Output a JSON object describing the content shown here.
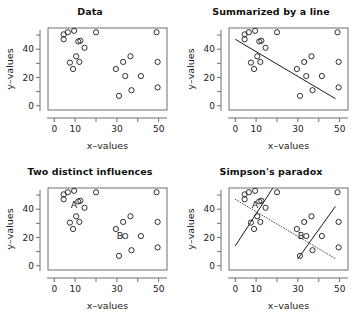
{
  "figure": {
    "width": 361,
    "height": 319,
    "background": "#ffffff",
    "ink_color": "#1a1a1a",
    "axis_color": "#6f6f6f"
  },
  "panels": [
    {
      "key": "data",
      "title": "Data",
      "xlabel": "x–values",
      "ylabel": "y–values"
    },
    {
      "key": "summarized",
      "title": "Summarized by a line",
      "xlabel": "x–values",
      "ylabel": "y–values"
    },
    {
      "key": "two_influences",
      "title": "Two distinct influences",
      "xlabel": "x–values",
      "ylabel": "y–values"
    },
    {
      "key": "simpsons",
      "title": "Simpson's paradox",
      "xlabel": "x–values",
      "ylabel": "y–values"
    }
  ],
  "axes": {
    "x_tick_values": [
      0,
      10,
      20,
      30,
      40,
      50
    ],
    "x_tick_labels": [
      "0",
      "10",
      "",
      "30",
      "",
      "50"
    ],
    "y_tick_values": [
      0,
      10,
      20,
      30,
      40,
      50
    ],
    "y_tick_labels": [
      "0",
      "",
      "20",
      "",
      "40",
      ""
    ],
    "xlim": [
      -3,
      54
    ],
    "ylim": [
      -3,
      55
    ]
  },
  "group_labels": [
    {
      "text": "A",
      "x": 9.5,
      "y": 41
    },
    {
      "text": "B",
      "x": 31.5,
      "y": 19
    }
  ],
  "chart_data": {
    "type": "scatter",
    "xlabel": "x–values",
    "ylabel": "y–values",
    "xlim": [
      -3,
      54
    ],
    "ylim": [
      -3,
      55
    ],
    "grid": false,
    "legend": "none",
    "marker": "open-circle",
    "x_ticks": [
      0,
      10,
      20,
      30,
      40,
      50
    ],
    "x_tick_labels": [
      "0",
      "10",
      "",
      "30",
      "",
      "50"
    ],
    "y_ticks": [
      0,
      10,
      20,
      30,
      40,
      50
    ],
    "y_tick_labels": [
      "0",
      "",
      "20",
      "",
      "40",
      ""
    ],
    "series": [
      {
        "name": "A",
        "annotation": "A",
        "points": [
          [
            4.5,
            50.5
          ],
          [
            4.5,
            47.0
          ],
          [
            6.5,
            52.0
          ],
          [
            9.5,
            53.0
          ],
          [
            7.5,
            30.5
          ],
          [
            9.0,
            26.0
          ],
          [
            10.5,
            35.0
          ],
          [
            11.5,
            45.5
          ],
          [
            12.0,
            31.0
          ],
          [
            12.5,
            46.0
          ],
          [
            14.5,
            41.0
          ],
          [
            20.0,
            52.0
          ]
        ]
      },
      {
        "name": "B",
        "annotation": "B",
        "points": [
          [
            29.5,
            26.0
          ],
          [
            31.0,
            7.0
          ],
          [
            33.0,
            31.0
          ],
          [
            34.0,
            21.0
          ],
          [
            36.5,
            35.0
          ],
          [
            37.0,
            11.0
          ],
          [
            41.5,
            21.0
          ],
          [
            49.0,
            52.0
          ],
          [
            49.5,
            31.0
          ],
          [
            49.5,
            13.0
          ]
        ]
      }
    ],
    "lines": [
      {
        "name": "overall-regression",
        "panels": [
          "summarized",
          "simpsons"
        ],
        "style": {
          "summarized": "solid",
          "simpsons": "dotted"
        },
        "x0": 0.0,
        "y0": 47.0,
        "x1": 48.0,
        "y1": 5.0,
        "slope": -0.875,
        "intercept": 47.0
      },
      {
        "name": "group-a-regression",
        "panels": [
          "simpsons"
        ],
        "style": "solid",
        "x0": 0.0,
        "y0": 14.0,
        "x1": 18.0,
        "y1": 55.0,
        "slope": 2.28,
        "intercept": 14.0
      },
      {
        "name": "group-b-regression",
        "panels": [
          "simpsons"
        ],
        "style": "solid",
        "x0": 30.0,
        "y0": 5.0,
        "x1": 48.0,
        "y1": 42.0,
        "slope": 2.06,
        "intercept": -56.7
      }
    ]
  }
}
